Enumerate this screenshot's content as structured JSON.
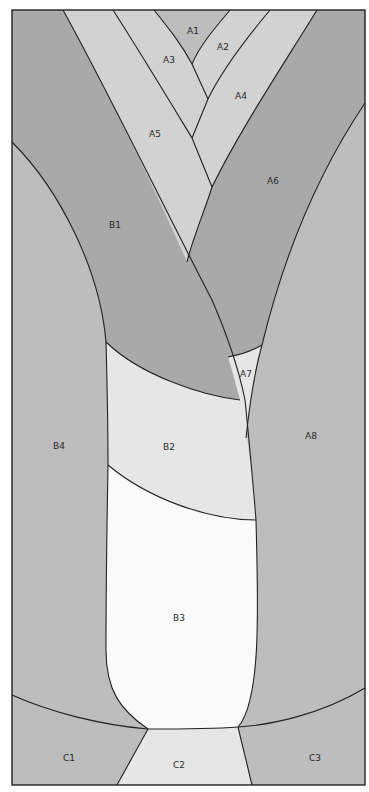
{
  "diagram": {
    "type": "quilt-pattern",
    "colors": {
      "dark": "#a9a9a9",
      "medium": "#bdbdbd",
      "light": "#d2d2d2",
      "lighter": "#e6e6e6",
      "white": "#fafafa",
      "line": "#222222"
    },
    "pieces": {
      "A1": "A1",
      "A2": "A2",
      "A3": "A3",
      "A4": "A4",
      "A5": "A5",
      "A6": "A6",
      "A7": "A7",
      "A8": "A8",
      "B1": "B1",
      "B2": "B2",
      "B3": "B3",
      "B4": "B4",
      "C1": "C1",
      "C2": "C2",
      "C3": "C3"
    }
  }
}
